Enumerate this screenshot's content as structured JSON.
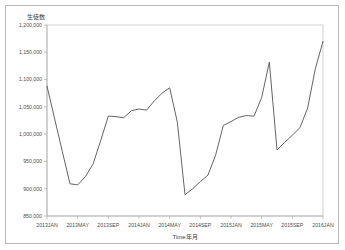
{
  "figure": {
    "background_color": "#ffffff",
    "frame_color": "#b9b9b9",
    "line_color": "#545454",
    "axis_color": "#a8a8a8",
    "series_title": "生徒数",
    "x_axis_title": "Time年月"
  },
  "chart_data": {
    "type": "line",
    "title": "",
    "series_label": "生徒数",
    "xlabel": "Time年月",
    "ylabel": "生徒数",
    "ylim": [
      850000,
      1200000
    ],
    "ytick_labels": [
      "1,200,000",
      "1,150,000",
      "1,100,000",
      "1,050,000",
      "1,000,000",
      "950,000",
      "900,000",
      "850,000"
    ],
    "ytick_values": [
      1200000,
      1150000,
      1100000,
      1050000,
      1000000,
      950000,
      900000,
      850000
    ],
    "xtick_labels": [
      "2013JAN",
      "2013MAY",
      "2013SEP",
      "2014JAN",
      "2014MAY",
      "2014SEP",
      "2015JAN",
      "2015MAY",
      "2015SEP",
      "2016JAN"
    ],
    "grid": false,
    "legend": "none",
    "x": [
      "2013JAN",
      "2013FEB",
      "2013MAR",
      "2013APR",
      "2013MAY",
      "2013JUN",
      "2013JUL",
      "2013AUG",
      "2013SEP",
      "2013OCT",
      "2013NOV",
      "2013DEC",
      "2014JAN",
      "2014FEB",
      "2014MAR",
      "2014APR",
      "2014MAY",
      "2014JUN",
      "2014JUL",
      "2014AUG",
      "2014SEP",
      "2014OCT",
      "2014NOV",
      "2014DEC",
      "2015JAN",
      "2015FEB",
      "2015MAR",
      "2015APR",
      "2015MAY",
      "2015JUN",
      "2015JUL",
      "2015AUG",
      "2015SEP",
      "2015OCT",
      "2015NOV",
      "2015DEC"
    ],
    "values": [
      1088000,
      1028000,
      968000,
      909000,
      907000,
      922000,
      945000,
      988000,
      1033000,
      1032000,
      1030000,
      1043000,
      1046000,
      1044000,
      1061000,
      1075000,
      1085000,
      1022000,
      889000,
      900000,
      913000,
      925000,
      962000,
      1016000,
      1023000,
      1031000,
      1034000,
      1033000,
      1067000,
      1132000,
      971000,
      985000,
      998000,
      1012000,
      1048000,
      1120000
    ],
    "annotations": [
      {
        "label": "series start",
        "x": "2013JAN",
        "y": 1088000
      },
      {
        "label": "first trough",
        "x": "2013MAY",
        "y": 907000
      },
      {
        "label": "deepest trough",
        "x": "2014JUL",
        "y": 889000
      },
      {
        "label": "spike peak",
        "x": "2015JUN",
        "y": 1132000
      },
      {
        "label": "series end",
        "x": "2015DEC",
        "y": 1170000
      }
    ]
  },
  "geometry": {
    "plot_left": 47,
    "plot_right": 323,
    "plot_top": 25,
    "plot_bottom": 216
  }
}
